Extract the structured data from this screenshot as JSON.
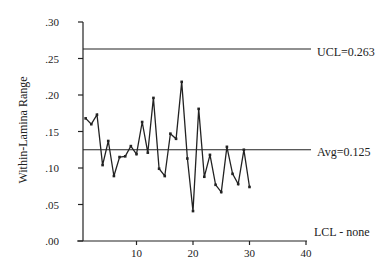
{
  "chart_data": {
    "type": "line",
    "title": "",
    "xlabel": "",
    "ylabel": "Within-Lamina Range",
    "xlim": [
      0,
      40
    ],
    "ylim": [
      0,
      0.3
    ],
    "grid": false,
    "x_ticks": [
      10,
      20,
      30,
      40
    ],
    "x_tick_labels": [
      "10",
      "20",
      "30",
      "40"
    ],
    "y_ticks": [
      0.0,
      0.05,
      0.1,
      0.15,
      0.2,
      0.25,
      0.3
    ],
    "y_tick_labels": [
      ".00",
      ".05",
      ".10",
      ".15",
      ".20",
      ".25",
      ".30"
    ],
    "x": [
      1,
      2,
      3,
      4,
      5,
      6,
      7,
      8,
      9,
      10,
      11,
      12,
      13,
      14,
      15,
      16,
      17,
      18,
      19,
      20,
      21,
      22,
      23,
      24,
      25,
      26,
      27,
      28,
      29,
      30
    ],
    "series": [
      {
        "name": "Within-Lamina Range",
        "values": [
          0.168,
          0.16,
          0.173,
          0.104,
          0.137,
          0.089,
          0.115,
          0.116,
          0.13,
          0.119,
          0.163,
          0.121,
          0.196,
          0.099,
          0.089,
          0.147,
          0.14,
          0.218,
          0.113,
          0.041,
          0.181,
          0.088,
          0.118,
          0.077,
          0.067,
          0.129,
          0.092,
          0.078,
          0.125,
          0.074
        ]
      }
    ],
    "reference_lines": [
      {
        "name": "UCL",
        "value": 0.263,
        "label": "UCL=0.263"
      },
      {
        "name": "Avg",
        "value": 0.125,
        "label": "Avg=0.125"
      }
    ],
    "annotations": [
      {
        "text": "LCL - none"
      }
    ]
  },
  "labels": {
    "ylabel": "Within-Lamina Range",
    "ucl": "UCL=0.263",
    "avg": "Avg=0.125",
    "lcl": "LCL - none"
  }
}
